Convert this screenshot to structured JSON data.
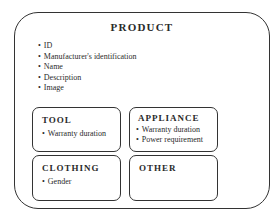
{
  "diagram": {
    "title": "PRODUCT",
    "attributes": [
      "ID",
      "Manufacturer's identification",
      "Name",
      "Description",
      "Image"
    ],
    "subtypes": {
      "tool": {
        "title": "TOOL",
        "attributes": [
          "Warranty duration"
        ]
      },
      "appliance": {
        "title": "APPLIANCE",
        "attributes": [
          "Warranty duration",
          "Power requirement"
        ]
      },
      "clothing": {
        "title": "CLOTHING",
        "attributes": [
          "Gender"
        ]
      },
      "other": {
        "title": "OTHER",
        "attributes": []
      }
    }
  }
}
